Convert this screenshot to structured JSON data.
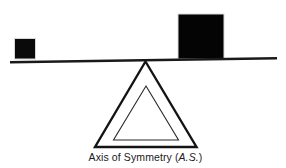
{
  "figure": {
    "type": "balance-scale-diagram",
    "background_color": "#ffffff",
    "stroke_color": "#111111",
    "fill_color": "#050505",
    "caption": {
      "prefix": "Axis of Symmetry (",
      "abbreviation": "A.S.",
      "suffix": ")",
      "full_text": "Axis of Symmetry (A.S.)"
    },
    "elements": {
      "small_block_label": "small block",
      "large_block_label": "large block",
      "beam_label": "balance beam",
      "fulcrum_outer_label": "outer fulcrum triangle",
      "fulcrum_inner_label": "inner fulcrum triangle"
    }
  }
}
